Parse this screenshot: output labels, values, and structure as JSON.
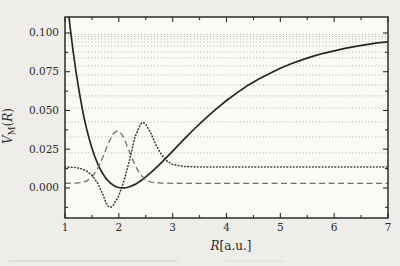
{
  "figure": {
    "kind": "morse-potential-figure",
    "colors": {
      "page_bg": "#efedea",
      "plot_bg": "#fbfaf7",
      "frame": "#2b2b2b",
      "solid_curve": "#262626",
      "dashed_curve": "#707070",
      "dotted_curve": "#3c3c3c",
      "level_line": "#a8a8a8",
      "text": "#2b2b2b"
    }
  },
  "chart_data": {
    "type": "line",
    "title": "",
    "xlabel": "R[a.u.]",
    "ylabel": "V_M(R)",
    "xlabel_parts": {
      "arg": "R",
      "unit": "[a.u.]"
    },
    "ylabel_parts": {
      "main": "V",
      "sub": "M",
      "open": "(",
      "arg": "R",
      "close": ")"
    },
    "xlim": [
      1,
      7
    ],
    "ylim": [
      -0.0194,
      0.1103
    ],
    "grid": "energy-levels-only",
    "legend": "none",
    "xticks": {
      "major": [
        1,
        2,
        3,
        4,
        5,
        6,
        7
      ],
      "labels": [
        "1",
        "2",
        "3",
        "4",
        "5",
        "6",
        "7"
      ],
      "minor": [
        1.5,
        2.5,
        3.5,
        4.5,
        5.5,
        6.5
      ]
    },
    "yticks": {
      "major": [
        0.0,
        0.025,
        0.05,
        0.075,
        0.1
      ],
      "labels": [
        "0.000",
        "0.025",
        "0.050",
        "0.075",
        "0.100"
      ],
      "minor": [
        -0.0125,
        0.0125,
        0.0375,
        0.0625,
        0.0875
      ]
    },
    "energy_levels": [
      0.0226,
      0.0329,
      0.0426,
      0.0516,
      0.0594,
      0.0665,
      0.0729,
      0.0787,
      0.0839,
      0.0877,
      0.0916,
      0.0942,
      0.0961,
      0.0977,
      0.099
    ],
    "series": [
      {
        "name": "morse-potential-curve",
        "style": "solid",
        "points": [
          [
            1.0,
            0.1347
          ],
          [
            1.05,
            0.1176
          ],
          [
            1.1,
            0.1021
          ],
          [
            1.15,
            0.0883
          ],
          [
            1.2,
            0.0758
          ],
          [
            1.25,
            0.0648
          ],
          [
            1.3,
            0.0549
          ],
          [
            1.35,
            0.0461
          ],
          [
            1.4,
            0.0384
          ],
          [
            1.45,
            0.0317
          ],
          [
            1.5,
            0.0257
          ],
          [
            1.55,
            0.0206
          ],
          [
            1.6,
            0.0162
          ],
          [
            1.65,
            0.0125
          ],
          [
            1.7,
            0.0093
          ],
          [
            1.75,
            0.0067
          ],
          [
            1.8,
            0.0046
          ],
          [
            1.85,
            0.0029
          ],
          [
            1.9,
            0.0017
          ],
          [
            1.95,
            0.0008
          ],
          [
            2.0,
            0.0003
          ],
          [
            2.05,
            0.0
          ],
          [
            2.1,
            0.0
          ],
          [
            2.15,
            0.0003
          ],
          [
            2.2,
            0.0008
          ],
          [
            2.25,
            0.0015
          ],
          [
            2.3,
            0.0023
          ],
          [
            2.35,
            0.0033
          ],
          [
            2.4,
            0.0045
          ],
          [
            2.45,
            0.0057
          ],
          [
            2.5,
            0.0071
          ],
          [
            2.6,
            0.0101
          ],
          [
            2.7,
            0.0133
          ],
          [
            2.8,
            0.0167
          ],
          [
            2.9,
            0.0202
          ],
          [
            3.0,
            0.0238
          ],
          [
            3.2,
            0.031
          ],
          [
            3.4,
            0.038
          ],
          [
            3.6,
            0.0446
          ],
          [
            3.8,
            0.0507
          ],
          [
            4.0,
            0.0564
          ],
          [
            4.2,
            0.0615
          ],
          [
            4.4,
            0.0662
          ],
          [
            4.6,
            0.0703
          ],
          [
            4.8,
            0.0739
          ],
          [
            5.0,
            0.0772
          ],
          [
            5.2,
            0.0801
          ],
          [
            5.4,
            0.0826
          ],
          [
            5.6,
            0.0849
          ],
          [
            5.8,
            0.0869
          ],
          [
            6.0,
            0.0885
          ],
          [
            6.2,
            0.0901
          ],
          [
            6.4,
            0.0913
          ],
          [
            6.6,
            0.0925
          ],
          [
            6.8,
            0.0936
          ],
          [
            7.0,
            0.0943
          ]
        ]
      },
      {
        "name": "ground-state-curve",
        "style": "dashed",
        "points": [
          [
            1.0,
            0.003
          ],
          [
            1.2,
            0.0031
          ],
          [
            1.3,
            0.0035
          ],
          [
            1.4,
            0.0044
          ],
          [
            1.5,
            0.0069
          ],
          [
            1.6,
            0.0119
          ],
          [
            1.7,
            0.0196
          ],
          [
            1.8,
            0.0285
          ],
          [
            1.9,
            0.0352
          ],
          [
            1.97,
            0.0368
          ],
          [
            2.05,
            0.0349
          ],
          [
            2.1,
            0.0317
          ],
          [
            2.2,
            0.0232
          ],
          [
            2.3,
            0.0147
          ],
          [
            2.4,
            0.0086
          ],
          [
            2.5,
            0.0052
          ],
          [
            2.6,
            0.0037
          ],
          [
            2.8,
            0.0031
          ],
          [
            3.0,
            0.003
          ],
          [
            3.5,
            0.003
          ],
          [
            4.0,
            0.003
          ],
          [
            4.5,
            0.003
          ],
          [
            5.0,
            0.003
          ],
          [
            5.5,
            0.003
          ],
          [
            6.0,
            0.003
          ],
          [
            6.5,
            0.003
          ],
          [
            7.0,
            0.003
          ]
        ]
      },
      {
        "name": "excited-state-curve",
        "style": "dotted",
        "points": [
          [
            1.0,
            0.0135
          ],
          [
            1.1,
            0.0134
          ],
          [
            1.2,
            0.0131
          ],
          [
            1.3,
            0.0124
          ],
          [
            1.4,
            0.011
          ],
          [
            1.5,
            0.0082
          ],
          [
            1.6,
            0.0035
          ],
          [
            1.7,
            -0.004
          ],
          [
            1.75,
            -0.0085
          ],
          [
            1.8,
            -0.0118
          ],
          [
            1.85,
            -0.0125
          ],
          [
            1.9,
            -0.011
          ],
          [
            1.95,
            -0.008
          ],
          [
            2.0,
            -0.005
          ],
          [
            2.1,
            0.005
          ],
          [
            2.2,
            0.018
          ],
          [
            2.3,
            0.033
          ],
          [
            2.4,
            0.0412
          ],
          [
            2.45,
            0.0422
          ],
          [
            2.5,
            0.041
          ],
          [
            2.6,
            0.035
          ],
          [
            2.7,
            0.027
          ],
          [
            2.8,
            0.021
          ],
          [
            2.9,
            0.0172
          ],
          [
            3.0,
            0.0152
          ],
          [
            3.2,
            0.0139
          ],
          [
            3.4,
            0.0136
          ],
          [
            3.6,
            0.0135
          ],
          [
            4.0,
            0.0135
          ],
          [
            4.5,
            0.0135
          ],
          [
            5.0,
            0.0135
          ],
          [
            5.5,
            0.0135
          ],
          [
            6.0,
            0.0135
          ],
          [
            6.5,
            0.0135
          ],
          [
            7.0,
            0.0135
          ]
        ]
      }
    ]
  }
}
